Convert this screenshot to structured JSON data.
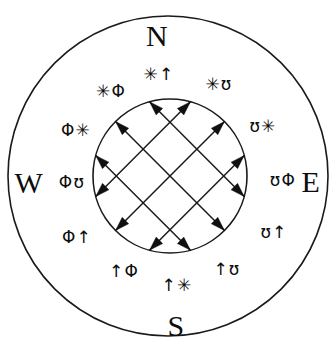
{
  "diagram": {
    "stroke_color": "#1a1a1a",
    "background_color": "#ffffff",
    "outer_circle": {
      "cx": 168,
      "cy": 176,
      "r": 160
    },
    "inner_circle": {
      "cx": 170,
      "cy": 176,
      "r": 77
    }
  },
  "cardinals": [
    {
      "id": "north",
      "label": "N",
      "x": 157,
      "y": 36
    },
    {
      "id": "east",
      "label": "E",
      "x": 311,
      "y": 182
    },
    {
      "id": "south",
      "label": "S",
      "x": 176,
      "y": 326
    },
    {
      "id": "west",
      "label": "W",
      "x": 29,
      "y": 183
    }
  ],
  "runes": [
    {
      "id": "rune-nnw",
      "label": "✳Φ",
      "x": 111,
      "y": 91,
      "position": "north-north-west"
    },
    {
      "id": "rune-n",
      "label": "✳↑",
      "x": 159,
      "y": 74,
      "position": "north"
    },
    {
      "id": "rune-nne",
      "label": "✳ʊ",
      "x": 219,
      "y": 84,
      "position": "north-north-east"
    },
    {
      "id": "rune-wnw",
      "label": "Φ✳",
      "x": 76,
      "y": 130,
      "position": "west-north-west"
    },
    {
      "id": "rune-ene",
      "label": "ʊ✳",
      "x": 263,
      "y": 126,
      "position": "east-north-east"
    },
    {
      "id": "rune-w",
      "label": "Φʊ",
      "x": 72,
      "y": 182,
      "position": "west"
    },
    {
      "id": "rune-e",
      "label": "ʊΦ",
      "x": 283,
      "y": 180,
      "position": "east"
    },
    {
      "id": "rune-wsw",
      "label": "Φ↑",
      "x": 77,
      "y": 237,
      "position": "west-south-west"
    },
    {
      "id": "rune-ese",
      "label": "ʊ↑",
      "x": 274,
      "y": 232,
      "position": "east-south-east"
    },
    {
      "id": "rune-ssw",
      "label": "↑Φ",
      "x": 124,
      "y": 271,
      "position": "south-south-west"
    },
    {
      "id": "rune-s",
      "label": "↑✳",
      "x": 177,
      "y": 285,
      "position": "south"
    },
    {
      "id": "rune-sse",
      "label": "↑ʊ",
      "x": 227,
      "y": 269,
      "position": "south-south-east"
    }
  ],
  "lattice": {
    "description": "Six double-headed diagonal chords forming a lattice inside the inner circle",
    "chord_count": 6,
    "directions": [
      "northeast",
      "northwest"
    ],
    "arrowheads_total": 12
  }
}
